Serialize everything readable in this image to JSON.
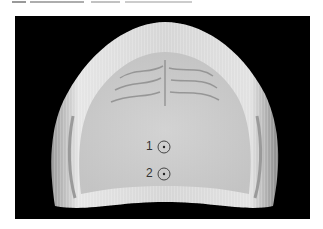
{
  "figure": {
    "background_color": "#000000",
    "cast_color": "#d9d9d9",
    "markers": [
      {
        "label": "1",
        "x": 164,
        "y": 147
      },
      {
        "label": "2",
        "x": 164,
        "y": 174
      }
    ]
  }
}
